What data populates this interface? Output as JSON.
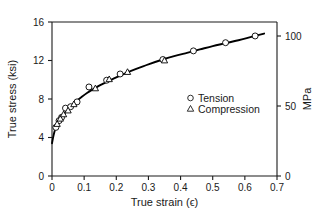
{
  "chart_data": {
    "type": "line",
    "title": "",
    "xlabel": "True strain (ϵ)",
    "ylabel": "True stress (ksi)",
    "ylabel_right": "MPa",
    "xlim": [
      0,
      0.7
    ],
    "ylim": [
      0,
      16
    ],
    "ylim_right": [
      0,
      110
    ],
    "grid": false,
    "legend_position": "center-right-inside",
    "xticks": [
      0,
      0.1,
      0.2,
      0.3,
      0.4,
      0.5,
      0.6,
      0.7
    ],
    "xticklabels": [
      "0",
      "0.1",
      "0.2",
      "0.3",
      "0.4",
      "0.5",
      "0.6",
      "0.7"
    ],
    "yticks": [
      0,
      4,
      8,
      12,
      16
    ],
    "yticklabels": [
      "0",
      "4",
      "8",
      "12",
      "16"
    ],
    "yticks_right": [
      0,
      50,
      100
    ],
    "yticklabels_right": [
      "0",
      "50",
      "100"
    ],
    "axis_colors": {
      "frame": "#1a1a1a",
      "curve": "#000000",
      "marker_fill": "#ffffff",
      "marker_edge": "#000000",
      "text": "#1a1a1a",
      "background": "#ffffff"
    },
    "fit_curve": {
      "name": "Flow curve fit",
      "x": [
        0.0,
        0.005,
        0.01,
        0.015,
        0.02,
        0.03,
        0.04,
        0.05,
        0.06,
        0.075,
        0.09,
        0.11,
        0.13,
        0.15,
        0.175,
        0.2,
        0.23,
        0.26,
        0.3,
        0.34,
        0.38,
        0.42,
        0.46,
        0.5,
        0.54,
        0.58,
        0.62,
        0.66
      ],
      "y": [
        3.4,
        4.25,
        4.85,
        5.25,
        5.55,
        6.1,
        6.55,
        6.95,
        7.3,
        7.75,
        8.15,
        8.65,
        9.05,
        9.45,
        9.85,
        10.25,
        10.7,
        11.1,
        11.6,
        12.05,
        12.45,
        12.8,
        13.15,
        13.5,
        13.8,
        14.1,
        14.45,
        14.8
      ]
    },
    "series": [
      {
        "name": "Tension",
        "marker": "circle",
        "points": [
          {
            "x": 0.012,
            "y": 5.05
          },
          {
            "x": 0.022,
            "y": 5.75
          },
          {
            "x": 0.03,
            "y": 6.1
          },
          {
            "x": 0.042,
            "y": 7.05
          },
          {
            "x": 0.058,
            "y": 7.2
          },
          {
            "x": 0.078,
            "y": 7.7
          },
          {
            "x": 0.115,
            "y": 9.25
          },
          {
            "x": 0.17,
            "y": 9.95
          },
          {
            "x": 0.212,
            "y": 10.6
          },
          {
            "x": 0.345,
            "y": 12.1
          },
          {
            "x": 0.44,
            "y": 13.0
          },
          {
            "x": 0.54,
            "y": 13.85
          },
          {
            "x": 0.632,
            "y": 14.55
          }
        ]
      },
      {
        "name": "Compression",
        "marker": "triangle",
        "points": [
          {
            "x": 0.016,
            "y": 5.4
          },
          {
            "x": 0.026,
            "y": 5.95
          },
          {
            "x": 0.036,
            "y": 6.4
          },
          {
            "x": 0.05,
            "y": 6.8
          },
          {
            "x": 0.068,
            "y": 7.45
          },
          {
            "x": 0.135,
            "y": 9.1
          },
          {
            "x": 0.178,
            "y": 10.05
          },
          {
            "x": 0.235,
            "y": 10.8
          },
          {
            "x": 0.35,
            "y": 12.0
          }
        ]
      }
    ],
    "legend": [
      {
        "marker": "circle",
        "label": "Tension"
      },
      {
        "marker": "triangle",
        "label": "Compression"
      }
    ]
  }
}
